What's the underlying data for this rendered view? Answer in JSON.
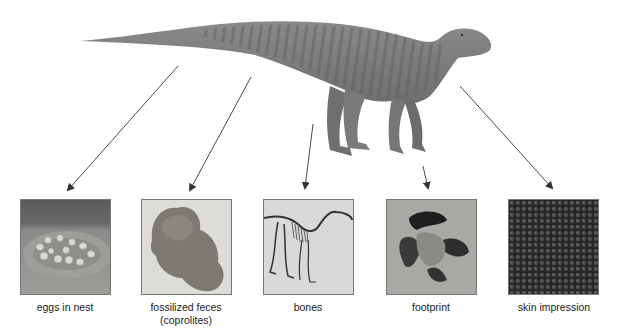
{
  "figure": {
    "arrows_from_subject_to_panels": 5
  },
  "panels": [
    {
      "id": "eggs",
      "label": "eggs in nest"
    },
    {
      "id": "coprolites",
      "label": "fossilized feces\n(coprolites)",
      "line1": "fossilized feces",
      "line2": "(coprolites)"
    },
    {
      "id": "bones",
      "label": "bones"
    },
    {
      "id": "footprint",
      "label": "footprint"
    },
    {
      "id": "skin",
      "label": "skin impression"
    }
  ],
  "colors": {
    "arrow": "#333333",
    "dino": "#7d7d7d",
    "border": "#777777"
  }
}
